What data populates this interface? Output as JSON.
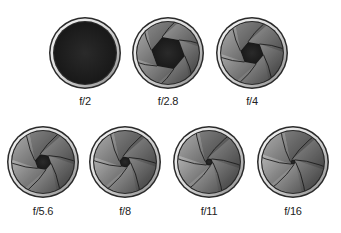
{
  "apertures": [
    {
      "label": "f/2",
      "cx": 85,
      "cy": 53,
      "opening": 1.0,
      "label_y": 95
    },
    {
      "label": "f/2.8",
      "cx": 168,
      "cy": 53,
      "opening": 0.55,
      "label_y": 95
    },
    {
      "label": "f/4",
      "cx": 252,
      "cy": 53,
      "opening": 0.38,
      "label_y": 95
    },
    {
      "label": "f/5.6",
      "cx": 43,
      "cy": 162,
      "opening": 0.27,
      "label_y": 205
    },
    {
      "label": "f/8",
      "cx": 125,
      "cy": 162,
      "opening": 0.19,
      "label_y": 205
    },
    {
      "label": "f/11",
      "cx": 209,
      "cy": 162,
      "opening": 0.13,
      "label_y": 205
    },
    {
      "label": "f/16",
      "cx": 293,
      "cy": 162,
      "opening": 0.09,
      "label_y": 205
    }
  ],
  "colors": {
    "ring_outer": "#2a2a2a",
    "ring_silver": "#d8d8d8",
    "hole": "#151515",
    "blade_light": "#f2f2f2",
    "blade_dark": "#3a3a3a"
  }
}
